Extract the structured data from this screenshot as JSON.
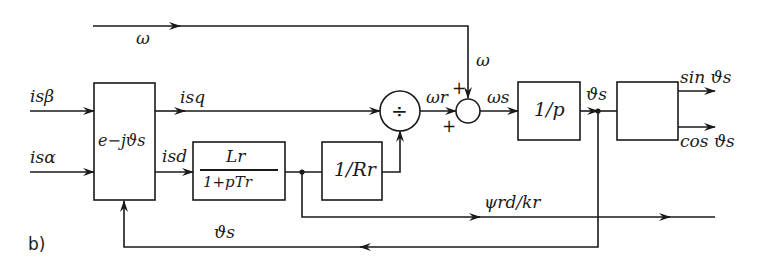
{
  "figure": {
    "panel_label": "b)",
    "type": "block diagram",
    "signals": {
      "omega_top": "ω",
      "omega_down": "ω",
      "i_s_beta": "isβ",
      "i_s_alpha": "isα",
      "i_sq": "isq",
      "i_sd": "isd",
      "omega_r": "ωr",
      "omega_s": "ωs",
      "theta_s_out": "ϑs",
      "theta_s_feedback": "ϑs",
      "psi_rd": "ψrd/kr",
      "sin_out": "sin ϑs",
      "cos_out": "cos ϑs"
    },
    "blocks": {
      "rotation": "e−jϑs",
      "lr_num": "Lr",
      "lr_den": "1+pTr",
      "inv_rr": "1/Rr",
      "integrator": "1/p",
      "trig": ""
    },
    "operators": {
      "divider": "÷",
      "sum_plus_top": "+",
      "sum_plus_left": "+"
    }
  }
}
